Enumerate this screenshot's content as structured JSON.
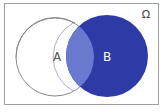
{
  "diagram": {
    "type": "venn",
    "universe_label": "Ω",
    "sets": [
      {
        "label": "A",
        "fill": "#ffffff",
        "stroke": "#8a8a8a"
      },
      {
        "label": "B",
        "fill": "#2e3aa6",
        "stroke": "#2e3aa6"
      }
    ],
    "intersection_fill": "#6a79cf",
    "shaded_region": "B",
    "colors": {
      "frame": "#a0a0a0",
      "label_a": "#555555",
      "label_b": "#ffffff",
      "omega": "#444444"
    }
  }
}
